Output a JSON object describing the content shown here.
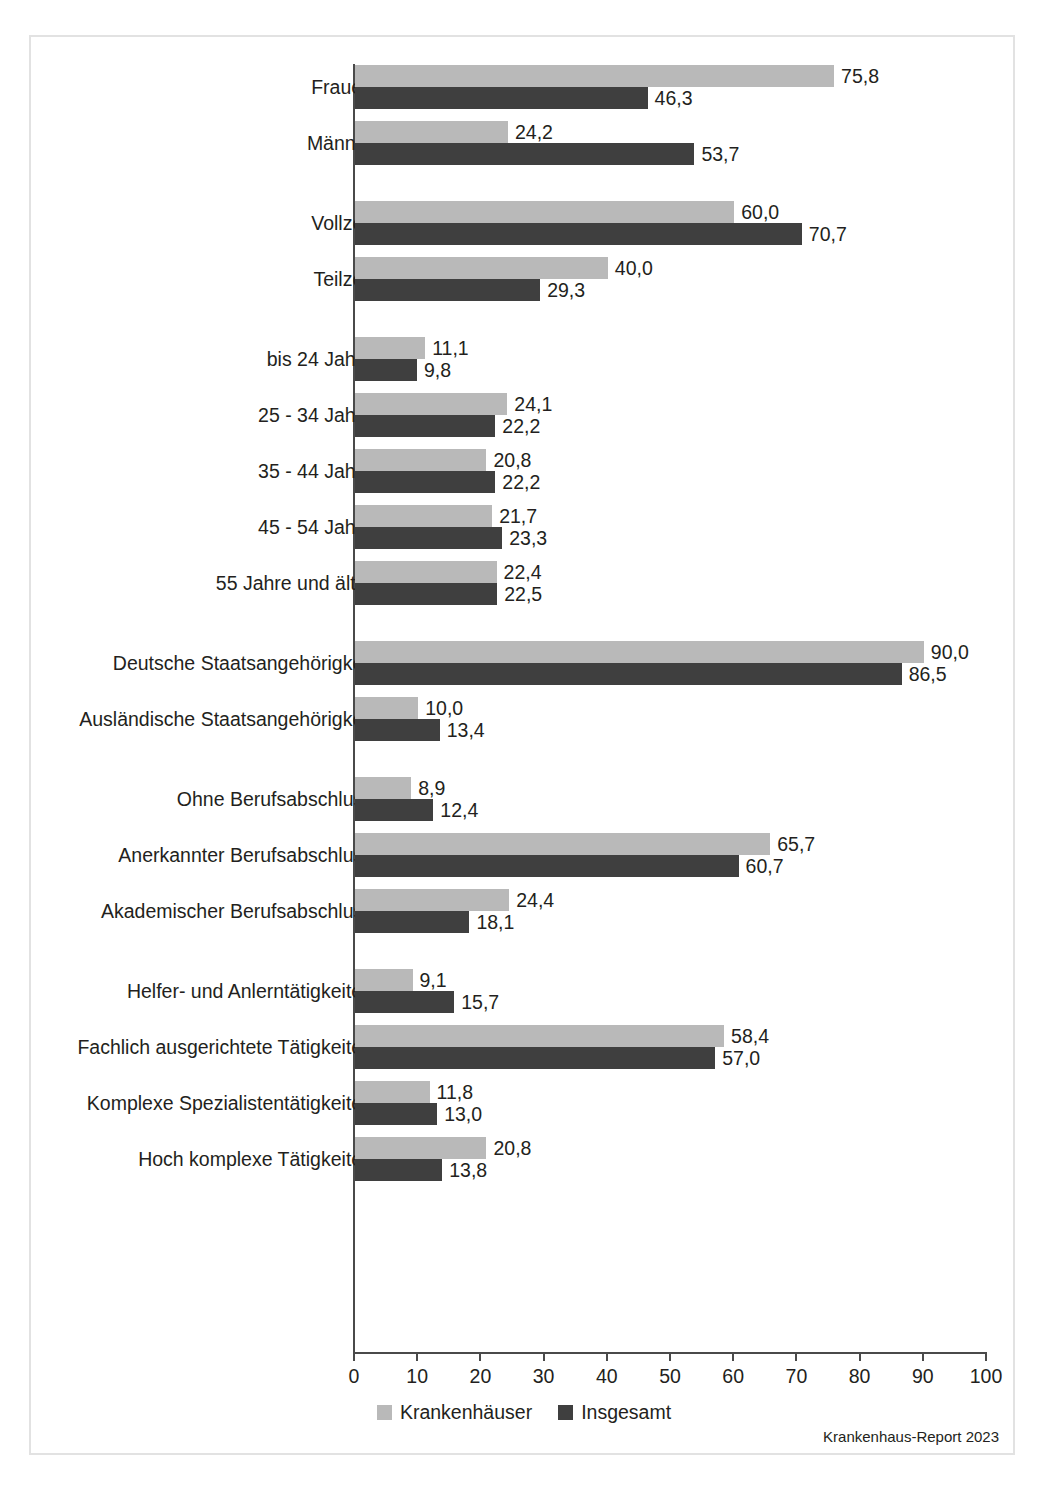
{
  "chart_data": {
    "type": "bar",
    "orientation": "horizontal",
    "title": "",
    "xlabel": "",
    "ylabel": "",
    "xlim": [
      0,
      100
    ],
    "grid": false,
    "legend_position": "bottom-center",
    "tick_labels": [
      "0",
      "10",
      "20",
      "30",
      "40",
      "50",
      "60",
      "70",
      "80",
      "90",
      "100"
    ],
    "ticks": [
      0,
      10,
      20,
      30,
      40,
      50,
      60,
      70,
      80,
      90,
      100
    ],
    "categories": [
      "Frauen",
      "Männer",
      "Vollzeit",
      "Teilzeit",
      "bis 24 Jahre",
      "25 - 34 Jahre",
      "35 - 44 Jahre",
      "45 - 54 Jahre",
      "55 Jahre und älter",
      "Deutsche Staatsangehörigkeit",
      "Ausländische Staatsangehörigkeit",
      "Ohne Berufsabschluss",
      "Anerkannter Berufsabschluss",
      "Akademischer Berufsabschluss",
      "Helfer- und Anlerntätigkeiten",
      "Fachlich ausgerichtete Tätigkeiten",
      "Komplexe Spezialistentätigkeiten",
      "Hoch komplexe Tätigkeiten"
    ],
    "series": [
      {
        "name": "Krankenhäuser",
        "color": "#b9b9b9",
        "values": [
          75.8,
          24.2,
          60.0,
          40.0,
          11.1,
          24.1,
          20.8,
          21.7,
          22.4,
          90.0,
          10.0,
          8.9,
          65.7,
          24.4,
          9.1,
          58.4,
          11.8,
          20.8
        ],
        "labels": [
          "75,8",
          "24,2",
          "60,0",
          "40,0",
          "11,1",
          "24,1",
          "20,8",
          "21,7",
          "22,4",
          "90,0",
          "10,0",
          "8,9",
          "65,7",
          "24,4",
          "9,1",
          "58,4",
          "11,8",
          "20,8"
        ]
      },
      {
        "name": "Insgesamt",
        "color": "#3f3f3f",
        "values": [
          46.3,
          53.7,
          70.7,
          29.3,
          9.8,
          22.2,
          22.2,
          23.3,
          22.5,
          86.5,
          13.4,
          12.4,
          60.7,
          18.1,
          15.7,
          57.0,
          13.0,
          13.8
        ],
        "labels": [
          "46,3",
          "53,7",
          "70,7",
          "29,3",
          "9,8",
          "22,2",
          "22,2",
          "23,3",
          "22,5",
          "86,5",
          "13,4",
          "12,4",
          "60,7",
          "18,1",
          "15,7",
          "57,0",
          "13,0",
          "13,8"
        ]
      }
    ],
    "groups": [
      {
        "name": "Geschlecht",
        "categories": [
          "Frauen",
          "Männer"
        ]
      },
      {
        "name": "Arbeitszeit",
        "categories": [
          "Vollzeit",
          "Teilzeit"
        ]
      },
      {
        "name": "Alter",
        "categories": [
          "bis 24 Jahre",
          "25 - 34 Jahre",
          "35 - 44 Jahre",
          "45 - 54 Jahre",
          "55 Jahre und älter"
        ]
      },
      {
        "name": "Staatsangehörigkeit",
        "categories": [
          "Deutsche Staatsangehörigkeit",
          "Ausländische Staatsangehörigkeit"
        ]
      },
      {
        "name": "Berufsabschluss",
        "categories": [
          "Ohne Berufsabschluss",
          "Anerkannter Berufsabschluss",
          "Akademischer Berufsabschluss"
        ]
      },
      {
        "name": "Anforderungsniveau",
        "categories": [
          "Helfer- und Anlerntätigkeiten",
          "Fachlich ausgerichtete Tätigkeiten",
          "Komplexe Spezialistentätigkeiten",
          "Hoch komplexe Tätigkeiten"
        ]
      }
    ]
  },
  "legend": {
    "items": [
      {
        "label": "Krankenhäuser",
        "color": "#b9b9b9"
      },
      {
        "label": "Insgesamt",
        "color": "#3f3f3f"
      }
    ]
  },
  "source_note": "Krankenhaus-Report 2023",
  "colors": {
    "series_light": "#b9b9b9",
    "series_dark": "#3f3f3f",
    "axis": "#4a4a4a",
    "frame": "#e2e2e2",
    "text": "#231f20"
  }
}
